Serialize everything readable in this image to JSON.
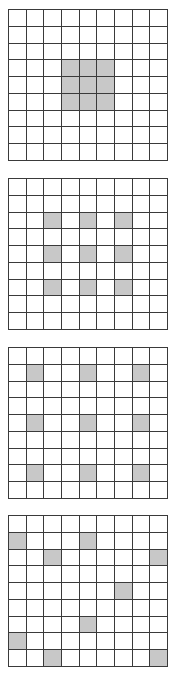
{
  "colors": {
    "shade": "#c8c8c8",
    "line": "#3a3a3a",
    "background": "#ffffff"
  },
  "grids": [
    {
      "id": "grid-1",
      "rows": 9,
      "cols": 9,
      "top": 9,
      "shaded": [
        [
          3,
          3
        ],
        [
          3,
          4
        ],
        [
          3,
          5
        ],
        [
          4,
          3
        ],
        [
          4,
          4
        ],
        [
          4,
          5
        ],
        [
          5,
          3
        ],
        [
          5,
          4
        ],
        [
          5,
          5
        ]
      ]
    },
    {
      "id": "grid-2",
      "rows": 9,
      "cols": 9,
      "top": 178,
      "shaded": [
        [
          2,
          2
        ],
        [
          2,
          4
        ],
        [
          2,
          6
        ],
        [
          4,
          2
        ],
        [
          4,
          4
        ],
        [
          4,
          6
        ],
        [
          6,
          2
        ],
        [
          6,
          4
        ],
        [
          6,
          6
        ]
      ]
    },
    {
      "id": "grid-3",
      "rows": 9,
      "cols": 9,
      "top": 347,
      "shaded": [
        [
          1,
          1
        ],
        [
          1,
          4
        ],
        [
          1,
          7
        ],
        [
          4,
          1
        ],
        [
          4,
          4
        ],
        [
          4,
          7
        ],
        [
          7,
          1
        ],
        [
          7,
          4
        ],
        [
          7,
          7
        ]
      ]
    },
    {
      "id": "grid-4",
      "rows": 9,
      "cols": 9,
      "top": 515,
      "shaded": [
        [
          1,
          0
        ],
        [
          1,
          4
        ],
        [
          2,
          2
        ],
        [
          2,
          8
        ],
        [
          4,
          6
        ],
        [
          6,
          4
        ],
        [
          7,
          0
        ],
        [
          8,
          2
        ],
        [
          8,
          8
        ]
      ]
    }
  ]
}
